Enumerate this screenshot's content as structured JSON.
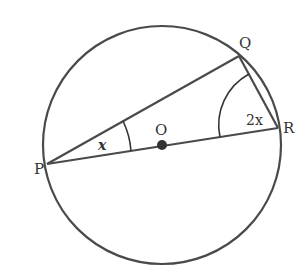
{
  "diagram": {
    "type": "circle-geometry",
    "colors": {
      "stroke": "#4a4a4a",
      "text": "#333333",
      "background": "#ffffff"
    },
    "circle": {
      "center_label": "O"
    },
    "points": [
      {
        "label": "P"
      },
      {
        "label": "Q"
      },
      {
        "label": "R"
      },
      {
        "label": "O"
      }
    ],
    "segments": [
      "PQ",
      "QR",
      "PR"
    ],
    "angles": [
      {
        "vertex": "P",
        "label": "x"
      },
      {
        "vertex": "R",
        "label": "2x"
      }
    ]
  }
}
